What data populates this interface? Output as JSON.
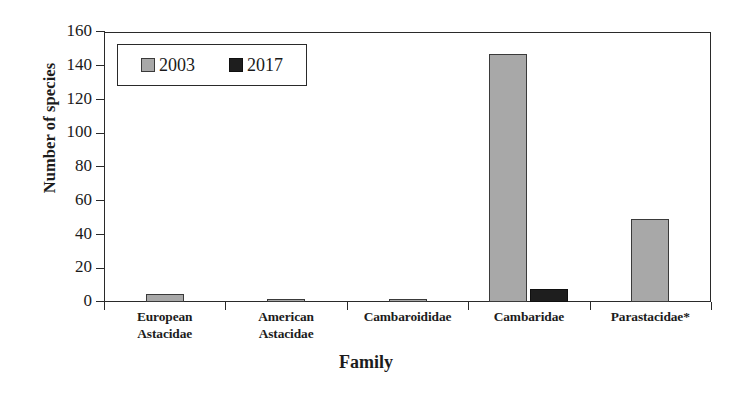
{
  "chart_data": {
    "type": "bar",
    "title": "",
    "xlabel": "Family",
    "ylabel": "Number of species",
    "categories": [
      "European Astacidae",
      "American Astacidae",
      "Cambaroididae",
      "Cambaridae",
      "Parastacidae*"
    ],
    "category_lines": [
      [
        "European",
        "Astacidae"
      ],
      [
        "American",
        "Astacidae"
      ],
      [
        "Cambaroididae",
        ""
      ],
      [
        "Cambaridae",
        ""
      ],
      [
        "Parastacidae*",
        ""
      ]
    ],
    "series": [
      {
        "name": "2003",
        "color": "#a8a8a8",
        "values": [
          5,
          2,
          2,
          147,
          49
        ]
      },
      {
        "name": "2017",
        "color": "#1e1e1e",
        "values": [
          0,
          0,
          0,
          8,
          0
        ]
      }
    ],
    "ylim": [
      0,
      160
    ],
    "yticks": [
      0,
      20,
      40,
      60,
      80,
      100,
      120,
      140,
      160
    ],
    "ytick_labels": [
      "0",
      "20",
      "40",
      "60",
      "80",
      "100",
      "120",
      "140",
      "160"
    ],
    "grid": false,
    "legend": {
      "position": "upper-left-inside",
      "entries": [
        {
          "label": "2003",
          "color": "#a8a8a8"
        },
        {
          "label": "2017",
          "color": "#1e1e1e"
        }
      ]
    }
  }
}
